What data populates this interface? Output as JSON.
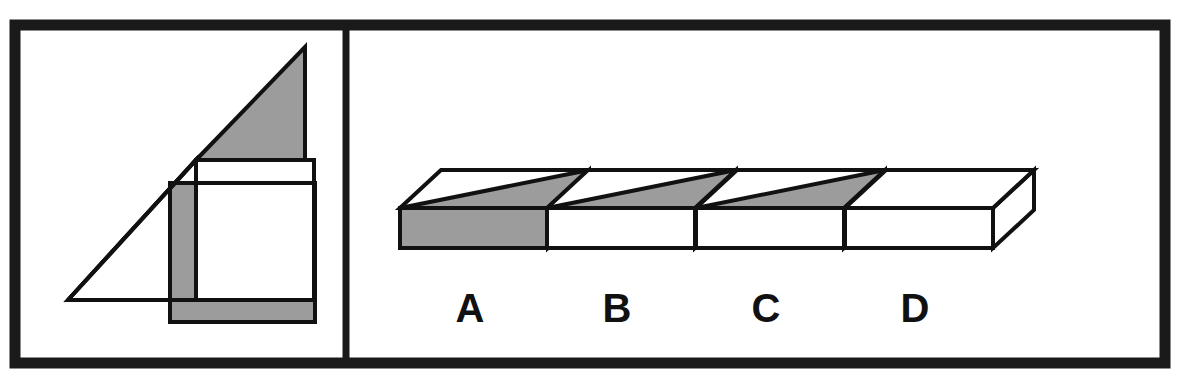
{
  "item": {
    "type": "spatial-reasoning-multiple-choice",
    "layout": "two-panel: stimulus on left, four answer options on right",
    "frame": {
      "border_color": "#1a1a1a",
      "border_thickness_px": 11,
      "background_color": "#ffffff",
      "divider_x": 346,
      "outer_rect": {
        "x": 15,
        "y": 25,
        "width": 1150,
        "height": 338
      }
    },
    "palette": {
      "line": "#111111",
      "shade_gray": "#9c9c9c",
      "white": "#ffffff",
      "frame_black": "#1a1a1a"
    }
  },
  "stimulus": {
    "name": "unfolded-net-of-flat-box",
    "description": "Flat pattern composed of an overlapping right triangle, a tall white rectangle and a gray rectangle forming a net",
    "shapes": [
      {
        "name": "gray-right-triangle",
        "fill": "shade_gray",
        "points": "196,178 196,300 305,300",
        "note": "shown mirrored as the upper-right shaded triangle"
      },
      {
        "name": "white-right-triangle-outline",
        "fill": "white",
        "points": "68,300 196,178 196,300"
      },
      {
        "name": "gray-wide-rectangle",
        "fill": "shade_gray",
        "rect": {
          "x": 170,
          "y": 183,
          "width": 145,
          "height": 139
        }
      },
      {
        "name": "white-tall-rectangle",
        "fill": "white",
        "rect": {
          "x": 196,
          "y": 160,
          "width": 118,
          "height": 140
        }
      }
    ]
  },
  "options": {
    "label_row_y": 322,
    "items": [
      {
        "id": "A",
        "label": "A",
        "label_x": 470,
        "box_origin_x": 398,
        "top_face": "split-diagonal",
        "top_left_half": "white",
        "top_right_half": "gray",
        "front_face": "gray",
        "side_face": "white"
      },
      {
        "id": "B",
        "label": "B",
        "label_x": 617,
        "box_origin_x": 545,
        "top_face": "split-diagonal",
        "top_left_half": "white",
        "top_right_half": "gray",
        "front_face": "white",
        "side_face": "white"
      },
      {
        "id": "C",
        "label": "C",
        "label_x": 766,
        "box_origin_x": 694,
        "top_face": "split-diagonal",
        "top_left_half": "white",
        "top_right_half": "gray",
        "front_face": "white",
        "side_face": "gray"
      },
      {
        "id": "D",
        "label": "D",
        "label_x": 915,
        "box_origin_x": 843,
        "top_face": "plain",
        "top_left_half": "white",
        "top_right_half": "white",
        "front_face": "white",
        "side_face": "white"
      }
    ]
  }
}
